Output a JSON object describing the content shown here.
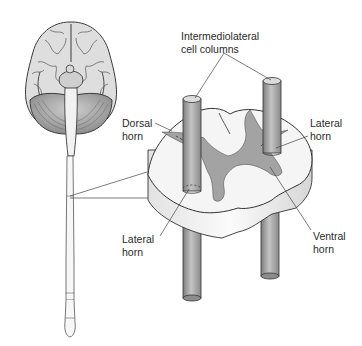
{
  "figure": {
    "colors": {
      "background": "#ffffff",
      "white_matter": "#f4f4f4",
      "gray_matter": "#9e9e9e",
      "column": "#a8a8a8",
      "outline": "#333333",
      "label_text": "#2a2a2a"
    }
  },
  "labels": {
    "intermediolateral": {
      "line1": "Intermediolateral",
      "line2": "cell columns"
    },
    "dorsal_horn": {
      "line1": "Dorsal",
      "line2": "horn"
    },
    "lateral_horn_right": {
      "line1": "Lateral",
      "line2": "horn"
    },
    "lateral_horn_left": {
      "line1": "Lateral",
      "line2": "horn"
    },
    "ventral_horn": {
      "line1": "Ventral",
      "line2": "horn"
    }
  }
}
